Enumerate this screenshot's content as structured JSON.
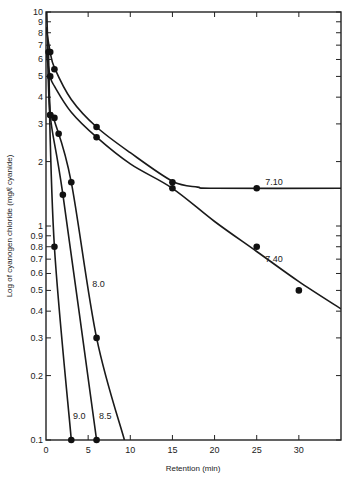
{
  "chart_data": {
    "type": "line",
    "title": "",
    "xlabel": "Retention (min)",
    "ylabel": "Log of cyanogen chloride (mg/ℓ cyanide)",
    "xlim": [
      0,
      35
    ],
    "ylim": [
      0.1,
      10
    ],
    "yscale": "log",
    "grid": false,
    "legend": "inline labels",
    "x_ticks": [
      0,
      5,
      10,
      15,
      20,
      25,
      30
    ],
    "x_tick_labels": [
      "0",
      "5",
      "10",
      "15",
      "20",
      "25",
      "30"
    ],
    "y_ticks": [
      0.1,
      0.2,
      0.3,
      0.4,
      0.5,
      0.6,
      0.7,
      0.8,
      0.9,
      1,
      2,
      3,
      4,
      5,
      6,
      7,
      8,
      9,
      10
    ],
    "y_tick_labels": [
      "0.1",
      "0.2",
      "0.3",
      "0.4",
      "0.5",
      "0.6",
      "0.7",
      "0.8",
      "0.9",
      "1",
      "2",
      "3",
      "4",
      "5",
      "6",
      "7",
      "8",
      "9",
      "10"
    ],
    "series": [
      {
        "name": "7.10",
        "label_pos": [
          26,
          1.55
        ],
        "points": [
          [
            0.5,
            6.5
          ],
          [
            1,
            5.4
          ],
          [
            6,
            2.9
          ],
          [
            15,
            1.6
          ],
          [
            25,
            1.5
          ]
        ],
        "curve": [
          [
            0,
            8.5
          ],
          [
            0.5,
            6.5
          ],
          [
            1,
            5.5
          ],
          [
            3,
            3.9
          ],
          [
            6,
            2.9
          ],
          [
            10,
            2.2
          ],
          [
            15,
            1.62
          ],
          [
            18,
            1.52
          ],
          [
            20,
            1.5
          ],
          [
            35,
            1.5
          ]
        ]
      },
      {
        "name": "7.40",
        "label_pos": [
          26,
          0.68
        ],
        "points": [
          [
            0.5,
            5.0
          ],
          [
            6,
            2.6
          ],
          [
            15,
            1.5
          ],
          [
            25,
            0.8
          ],
          [
            30,
            0.5
          ]
        ],
        "curve": [
          [
            0,
            6.5
          ],
          [
            0.5,
            5.0
          ],
          [
            1,
            4.5
          ],
          [
            3,
            3.4
          ],
          [
            6,
            2.6
          ],
          [
            10,
            1.95
          ],
          [
            15,
            1.5
          ],
          [
            20,
            1.05
          ],
          [
            25,
            0.76
          ],
          [
            30,
            0.55
          ],
          [
            35,
            0.41
          ]
        ]
      },
      {
        "name": "8.0",
        "label_pos": [
          5.5,
          0.52
        ],
        "points": [
          [
            0.5,
            3.3
          ],
          [
            1,
            3.2
          ],
          [
            1.5,
            2.7
          ],
          [
            3,
            1.6
          ],
          [
            6,
            0.3
          ]
        ],
        "curve": [
          [
            0.3,
            6.5
          ],
          [
            0.5,
            3.4
          ],
          [
            1,
            3.1
          ],
          [
            3,
            1.6
          ],
          [
            6,
            0.3
          ],
          [
            9.3,
            0.1
          ]
        ]
      },
      {
        "name": "8.5",
        "label_pos": [
          6.3,
          0.125
        ],
        "points": [
          [
            0.3,
            6.5
          ],
          [
            0.5,
            3.3
          ],
          [
            2,
            1.4
          ],
          [
            6,
            0.1
          ]
        ],
        "curve": [
          [
            0.2,
            7.0
          ],
          [
            0.5,
            3.3
          ],
          [
            2,
            1.4
          ],
          [
            6,
            0.1
          ]
        ]
      },
      {
        "name": "9.0",
        "label_pos": [
          3.2,
          0.125
        ],
        "points": [
          [
            1,
            0.8
          ],
          [
            3,
            0.1
          ]
        ],
        "curve": [
          [
            0.1,
            10
          ],
          [
            0.3,
            5.2
          ],
          [
            1,
            0.8
          ],
          [
            3,
            0.1
          ]
        ]
      }
    ]
  }
}
